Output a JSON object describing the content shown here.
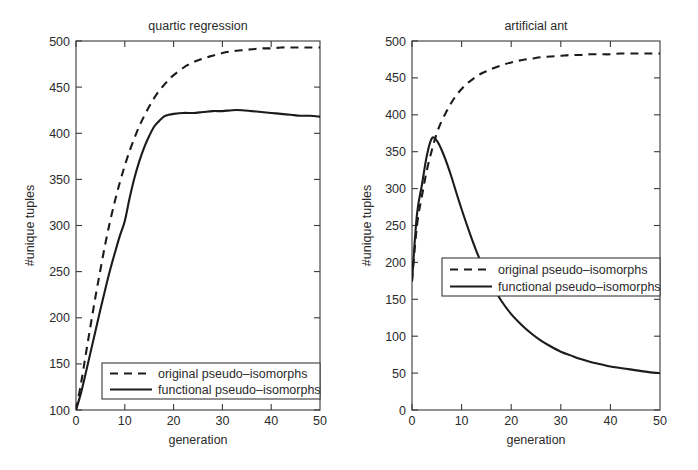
{
  "figure": {
    "background_color": "#ffffff",
    "line_color": "#1b1b1b",
    "axis_color": "#3a3a3a",
    "text_color": "#2b2b2b"
  },
  "panels": {
    "left": {
      "title": "quartic regression",
      "xlabel": "generation",
      "ylabel": "#unique tuples",
      "xticks": [
        "0",
        "10",
        "20",
        "30",
        "40",
        "50"
      ],
      "yticks": [
        "100",
        "150",
        "200",
        "250",
        "300",
        "350",
        "400",
        "450",
        "500"
      ],
      "legend": {
        "entries": [
          {
            "label": "original pseudo–isomorphs",
            "style": "dashed"
          },
          {
            "label": "functional pseudo–isomorphs",
            "style": "solid"
          }
        ]
      }
    },
    "right": {
      "title": "artificial ant",
      "xlabel": "generation",
      "ylabel": "#unique tuples",
      "xticks": [
        "0",
        "10",
        "20",
        "30",
        "40",
        "50"
      ],
      "yticks": [
        "0",
        "50",
        "100",
        "150",
        "200",
        "250",
        "300",
        "350",
        "400",
        "450",
        "500"
      ],
      "legend": {
        "entries": [
          {
            "label": "original pseudo–isomorphs",
            "style": "dashed"
          },
          {
            "label": "functional pseudo–isomorphs",
            "style": "solid"
          }
        ]
      }
    }
  },
  "chart_data": [
    {
      "type": "line",
      "title": "quartic regression",
      "xlabel": "generation",
      "ylabel": "#unique tuples",
      "xlim": [
        0,
        50
      ],
      "ylim": [
        100,
        500
      ],
      "xticks": [
        0,
        10,
        20,
        30,
        40,
        50
      ],
      "yticks": [
        100,
        150,
        200,
        250,
        300,
        350,
        400,
        450,
        500
      ],
      "grid": false,
      "legend_position": "lower right",
      "x": [
        0,
        1,
        2,
        3,
        4,
        5,
        6,
        7,
        8,
        9,
        10,
        11,
        12,
        13,
        14,
        15,
        16,
        17,
        18,
        19,
        20,
        22,
        24,
        26,
        28,
        30,
        32,
        34,
        36,
        38,
        40,
        42,
        44,
        46,
        48,
        50
      ],
      "series": [
        {
          "name": "original pseudo–isomorphs",
          "style": "dashed",
          "values": [
            100,
            128,
            160,
            192,
            223,
            252,
            280,
            305,
            327,
            347,
            365,
            381,
            395,
            408,
            419,
            429,
            438,
            446,
            452,
            458,
            463,
            471,
            477,
            481,
            484,
            487,
            489,
            490,
            491,
            492,
            492,
            493,
            493,
            493,
            493,
            493
          ]
        },
        {
          "name": "functional pseudo–isomorphs",
          "style": "solid",
          "values": [
            100,
            118,
            140,
            163,
            186,
            209,
            231,
            252,
            271,
            289,
            305,
            330,
            352,
            370,
            385,
            397,
            407,
            413,
            418,
            420,
            421,
            422,
            422,
            423,
            424,
            424,
            425,
            425,
            424,
            423,
            422,
            421,
            420,
            419,
            419,
            418
          ]
        }
      ]
    },
    {
      "type": "line",
      "title": "artificial ant",
      "xlabel": "generation",
      "ylabel": "#unique tuples",
      "xlim": [
        0,
        50
      ],
      "ylim": [
        0,
        500
      ],
      "xticks": [
        0,
        10,
        20,
        30,
        40,
        50
      ],
      "yticks": [
        0,
        50,
        100,
        150,
        200,
        250,
        300,
        350,
        400,
        450,
        500
      ],
      "grid": false,
      "legend_position": "center left",
      "x": [
        0,
        1,
        2,
        3,
        4,
        5,
        6,
        7,
        8,
        9,
        10,
        11,
        12,
        13,
        14,
        15,
        16,
        18,
        20,
        22,
        24,
        26,
        28,
        30,
        32,
        34,
        36,
        38,
        40,
        42,
        44,
        46,
        48,
        50
      ],
      "series": [
        {
          "name": "original pseudo–isomorphs",
          "style": "dashed",
          "values": [
            175,
            250,
            290,
            325,
            352,
            375,
            392,
            405,
            417,
            427,
            435,
            442,
            447,
            452,
            456,
            459,
            462,
            467,
            471,
            474,
            476,
            478,
            479,
            480,
            481,
            481,
            482,
            482,
            482,
            483,
            483,
            483,
            483,
            483
          ]
        },
        {
          "name": "functional pseudo–isomorphs",
          "style": "solid",
          "values": [
            175,
            265,
            305,
            345,
            368,
            365,
            352,
            335,
            315,
            293,
            272,
            252,
            233,
            215,
            199,
            184,
            171,
            148,
            130,
            116,
            104,
            94,
            86,
            79,
            74,
            69,
            65,
            62,
            59,
            57,
            55,
            53,
            51,
            50
          ]
        }
      ]
    }
  ]
}
